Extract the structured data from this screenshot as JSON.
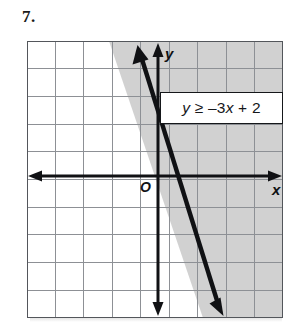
{
  "problem": {
    "number_label": "7."
  },
  "callout": {
    "equation_plain": "y ≥ –3x + 2",
    "lhs": "y",
    "relation": "≥",
    "rhs": "–3x + 2"
  },
  "axes": {
    "x_label": "x",
    "y_label": "y",
    "origin_label": "O"
  },
  "colors": {
    "grid_line": "#8d9095",
    "grid_border": "#53565b",
    "axis": "#101114",
    "boundary_line": "#101114",
    "shade_fill": "#cfcfcf",
    "background": "#ffffff",
    "text": "#15171a"
  },
  "chart_data": {
    "type": "line",
    "title": "",
    "subtitle": "",
    "xlabel": "x",
    "ylabel": "y",
    "grid": true,
    "legend": "none",
    "annotations": [
      {
        "name": "inequality-callout",
        "text": "y ≥ –3x + 2"
      },
      {
        "name": "origin",
        "text": "O"
      }
    ],
    "xlim": [
      -5,
      4
    ],
    "ylim": [
      -5,
      5
    ],
    "xticks": [
      -5,
      -4,
      -3,
      -2,
      -1,
      0,
      1,
      2,
      3,
      4
    ],
    "yticks": [
      -5,
      -4,
      -3,
      -2,
      -1,
      0,
      1,
      2,
      3,
      4,
      5
    ],
    "grid_columns": 9,
    "grid_rows": 10,
    "series": [
      {
        "name": "boundary line y = -3x + 2",
        "type": "line",
        "style": "solid",
        "slope": -3,
        "intercept": 2,
        "arrow_both_ends": true,
        "x": [
          -0.75,
          2.4
        ],
        "y": [
          4.25,
          -5.2
        ]
      },
      {
        "name": "shaded region y >= -3x + 2",
        "type": "area",
        "fill": "#cfcfcf",
        "side": "above-right",
        "inclusive": true
      }
    ]
  }
}
